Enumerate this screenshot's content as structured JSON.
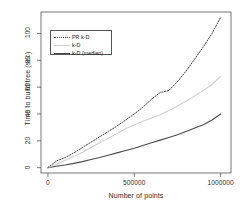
{
  "chart_data": {
    "type": "line",
    "title": "",
    "xlabel": "Number of points",
    "ylabel": "Time to build tree (sec)",
    "xlim": [
      -40000,
      1060000
    ],
    "ylim": [
      -4,
      116
    ],
    "xticks": [
      0,
      500000,
      1000000
    ],
    "xticklabels": [
      "0",
      "500000",
      "1000000"
    ],
    "yticks": [
      0,
      20,
      40,
      60,
      80,
      100
    ],
    "yticklabels": [
      "0",
      "20",
      "40",
      "60",
      "80",
      "100"
    ],
    "grid": false,
    "legend_position": "top-left",
    "x": [
      0,
      50000,
      100000,
      150000,
      200000,
      250000,
      300000,
      350000,
      400000,
      450000,
      500000,
      550000,
      600000,
      650000,
      700000,
      750000,
      800000,
      850000,
      900000,
      950000,
      1000000
    ],
    "series": [
      {
        "name": "PR k-D",
        "style": "dotted",
        "color": "#444444",
        "values": [
          0,
          5,
          7.5,
          11,
          15,
          19,
          23,
          27,
          31,
          35.5,
          40,
          45,
          51,
          56,
          57.5,
          64,
          72,
          81,
          90,
          100,
          112
        ]
      },
      {
        "name": "k-D",
        "style": "solid",
        "color": "#cfcfcf",
        "values": [
          0,
          2.5,
          5.5,
          8.5,
          11.5,
          15,
          18.5,
          22,
          25.5,
          29,
          32,
          34.5,
          37,
          39.5,
          42.5,
          46,
          49.5,
          53.5,
          57.5,
          62,
          68
        ]
      },
      {
        "name": "k-D (median)",
        "style": "solid",
        "color": "#4a4a4a",
        "values": [
          0,
          1,
          2,
          3.2,
          4.5,
          6,
          7.5,
          9.2,
          11,
          12.8,
          14.5,
          16.5,
          18.5,
          20.5,
          22.5,
          24.5,
          27,
          29.5,
          32,
          35.5,
          40
        ]
      }
    ]
  },
  "legend": {
    "items": [
      {
        "label": "PR k-D"
      },
      {
        "label": "k-D"
      },
      {
        "label": "k-D (median)"
      }
    ]
  }
}
